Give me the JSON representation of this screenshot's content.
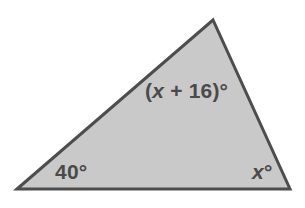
{
  "figure": {
    "type": "triangle-angle-diagram",
    "canvas": {
      "width": 305,
      "height": 208,
      "background": "#ffffff"
    },
    "shape": {
      "name": "triangle",
      "fill": "#c9c9c9",
      "stroke": "#4d4d4d",
      "stroke_width": 3,
      "points": "17,189 213,20 290,189",
      "vertices": [
        {
          "name": "left",
          "x": 17,
          "y": 189
        },
        {
          "name": "top",
          "x": 213,
          "y": 20
        },
        {
          "name": "right",
          "x": 290,
          "y": 189
        }
      ]
    },
    "labels": {
      "top": "(x + 16)°",
      "top_parts": {
        "open": "(",
        "variable": "x",
        "operator": " + ",
        "constant": "16",
        "close": ")",
        "degree": "°"
      },
      "left": "40°",
      "left_parts": {
        "value": "40",
        "degree": "°"
      },
      "right": "x°",
      "right_parts": {
        "variable": "x",
        "degree": "°"
      }
    },
    "text_color": "#4a4a4a"
  }
}
